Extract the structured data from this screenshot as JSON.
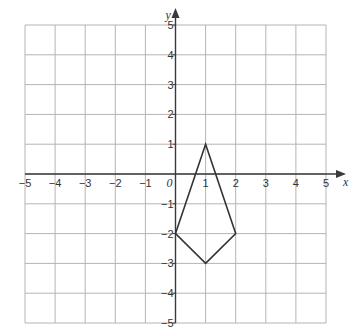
{
  "chart_data": {
    "type": "line",
    "title": "",
    "xlabel": "x",
    "ylabel": "y",
    "xlim": [
      -5,
      5
    ],
    "ylim": [
      -5,
      5
    ],
    "grid": true,
    "origin_label": "0",
    "x_ticks": [
      -5,
      -4,
      -3,
      -2,
      -1,
      1,
      2,
      3,
      4,
      5
    ],
    "y_ticks": [
      5,
      4,
      3,
      2,
      1,
      -1,
      -2,
      -3,
      -4,
      -5
    ],
    "x_tick_labels": [
      "−5",
      "−4",
      "−3",
      "−2",
      "−1",
      "1",
      "2",
      "3",
      "4",
      "5"
    ],
    "y_tick_labels": [
      "5",
      "4",
      "3",
      "2",
      "1",
      "−1",
      "−2",
      "−3",
      "−4",
      "−5"
    ],
    "series": [
      {
        "name": "kite",
        "closed": true,
        "points": [
          [
            1,
            1
          ],
          [
            2,
            -2
          ],
          [
            1,
            -3
          ],
          [
            0,
            -2
          ]
        ]
      }
    ]
  }
}
